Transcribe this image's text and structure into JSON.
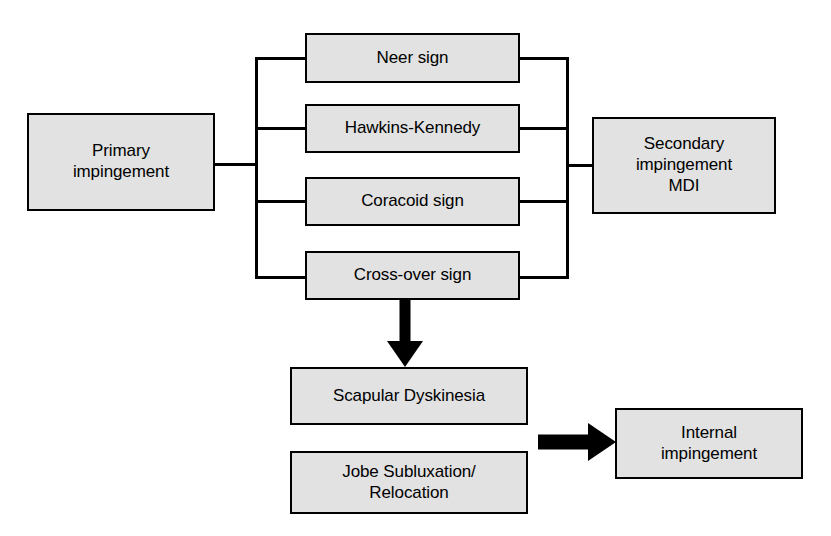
{
  "diagram": {
    "background_color": "#ffffff",
    "box_fill_color": "#e2e2e2",
    "box_border_color": "#000000",
    "text_color": "#000000",
    "nodes": {
      "primary_impingement": "Primary\nimpingement",
      "neer_sign": "Neer sign",
      "hawkins_kennedy": "Hawkins-Kennedy",
      "coracoid_sign": "Coracoid sign",
      "cross_over_sign": "Cross-over sign",
      "secondary_impingement": "Secondary\nimpingement\nMDI",
      "scapular_dyskinesia": "Scapular Dyskinesia",
      "jobe_subluxation": "Jobe Subluxation/\nRelocation",
      "internal_impingement": "Internal\nimpingement"
    },
    "edges": [
      {
        "id": "primary-to-tests",
        "from": "primary_impingement",
        "to": [
          "neer_sign",
          "hawkins_kennedy",
          "coracoid_sign",
          "cross_over_sign"
        ],
        "style": "thin-bracket"
      },
      {
        "id": "tests-to-secondary",
        "from": [
          "neer_sign",
          "hawkins_kennedy",
          "coracoid_sign",
          "cross_over_sign"
        ],
        "to": "secondary_impingement",
        "style": "thin-bracket"
      },
      {
        "id": "crossover-to-scapular",
        "from": "cross_over_sign",
        "to": "scapular_dyskinesia",
        "style": "thick-arrow-down"
      },
      {
        "id": "jobe-to-internal",
        "from": "jobe_subluxation",
        "to": "internal_impingement",
        "style": "thick-arrow-right"
      }
    ]
  }
}
